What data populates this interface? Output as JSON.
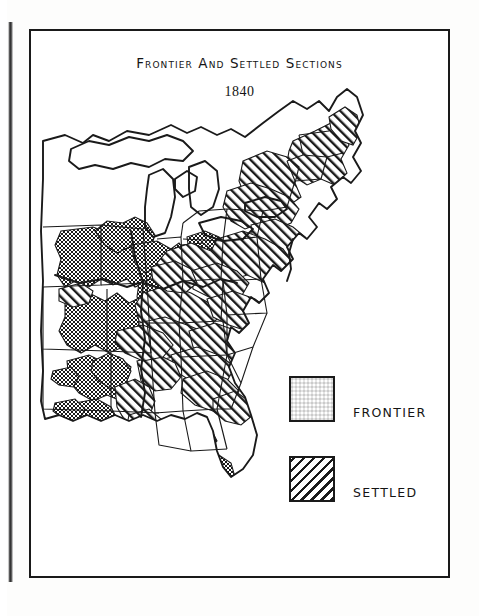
{
  "document": {
    "kind": "historical-map-plate",
    "title": "Frontier and Settled Sections",
    "date": "1840",
    "background_color": "#ffffff",
    "ink_color": "#1a1a1a"
  },
  "legend": {
    "items": [
      {
        "key": "frontier",
        "label": "FRONTIER",
        "pattern": "stipple",
        "pattern_color": "#1a1a1a"
      },
      {
        "key": "settled",
        "label": "SETTLED",
        "pattern": "diagonal-hatch",
        "pattern_color": "#1a1a1a"
      }
    ]
  },
  "map": {
    "region": "Eastern United States",
    "projection_note": "outline map of the eastern United States with Great Lakes, state boundaries, Florida peninsula and Atlantic/Gulf coasts",
    "features": [
      "Great Lakes",
      "Mississippi River valley",
      "Atlantic coastline",
      "Gulf of Mexico coastline",
      "Florida peninsula",
      "state boundary lines"
    ],
    "classification_areas": {
      "settled_regions": [
        "New England",
        "New York",
        "Pennsylvania",
        "New Jersey",
        "Maryland",
        "Virginia",
        "Ohio",
        "Kentucky",
        "Tennessee",
        "North Carolina piedmont",
        "South Carolina piedmont",
        "lower Mississippi valley"
      ],
      "frontier_regions": [
        "Iowa",
        "Wisconsin",
        "Michigan interior",
        "northern Illinois",
        "Missouri",
        "Arkansas",
        "northern Florida",
        "southern Georgia",
        "Alabama interior",
        "Mississippi interior"
      ],
      "unclassified_regions": [
        "Maine interior",
        "southern Florida peninsula",
        "western plains beyond the frontier line"
      ]
    }
  }
}
